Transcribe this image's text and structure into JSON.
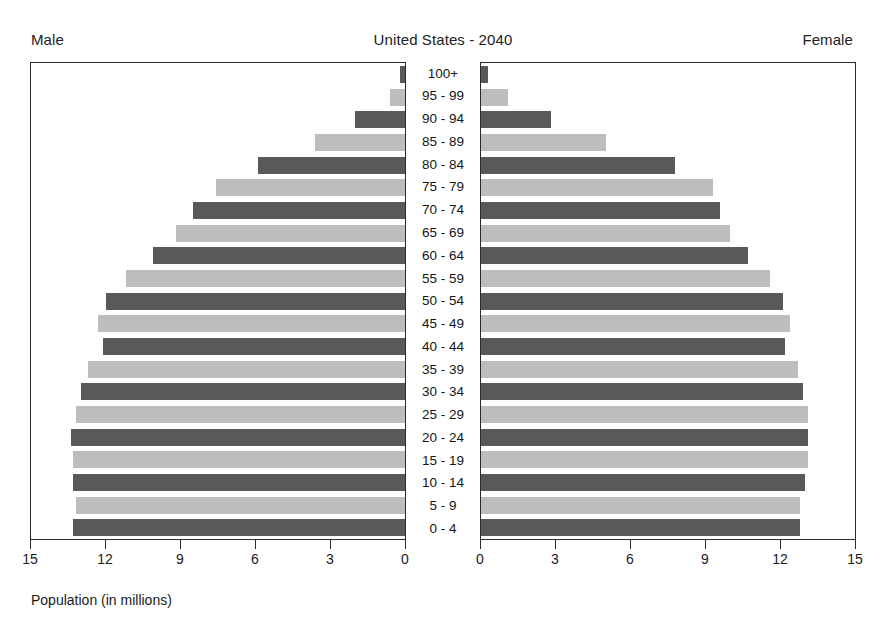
{
  "header": {
    "title": "United States - 2040",
    "male_label": "Male",
    "female_label": "Female"
  },
  "axis": {
    "caption": "Population (in millions)",
    "male_ticks": [
      "15",
      "12",
      "9",
      "6",
      "3",
      "0"
    ],
    "female_ticks": [
      "0",
      "3",
      "6",
      "9",
      "12",
      "15"
    ]
  },
  "chart_data": {
    "type": "bar",
    "subtype": "population-pyramid",
    "title": "United States - 2040",
    "xlabel": "Population (in millions)",
    "ylabel": "",
    "xlim": [
      0,
      15
    ],
    "grid": false,
    "legend": false,
    "categories": [
      "100+",
      "95 - 99",
      "90 - 94",
      "85 - 89",
      "80 - 84",
      "75 - 79",
      "70 - 74",
      "65 - 69",
      "60 - 64",
      "55 - 59",
      "50 - 54",
      "45 - 49",
      "40 - 44",
      "35 - 39",
      "30 - 34",
      "25 - 29",
      "20 - 24",
      "15 - 19",
      "10 - 14",
      "5 - 9",
      "0 - 4"
    ],
    "series": [
      {
        "name": "Male",
        "side": "left",
        "color": "#595959",
        "values": [
          0.2,
          0.6,
          2.0,
          3.6,
          5.9,
          7.6,
          8.5,
          9.2,
          10.1,
          11.2,
          12.0,
          12.3,
          12.1,
          12.7,
          13.0,
          13.2,
          13.4,
          13.3,
          13.3,
          13.2,
          13.3
        ]
      },
      {
        "name": "Female",
        "side": "right",
        "color": "#bdbdbd",
        "values": [
          0.3,
          1.1,
          2.8,
          5.0,
          7.8,
          9.3,
          9.6,
          10.0,
          10.7,
          11.6,
          12.1,
          12.4,
          12.2,
          12.7,
          12.9,
          13.1,
          13.1,
          13.1,
          13.0,
          12.8,
          12.8
        ]
      }
    ],
    "bar_shades": [
      "dark",
      "light",
      "dark",
      "light",
      "dark",
      "light",
      "dark",
      "light",
      "dark",
      "light",
      "dark",
      "light",
      "dark",
      "light",
      "dark",
      "light",
      "dark",
      "light",
      "dark",
      "light",
      "dark"
    ],
    "colors": {
      "dark": "#595959",
      "light": "#bdbdbd",
      "frame": "#2b2b2b",
      "text": "#1a1a1a"
    }
  }
}
